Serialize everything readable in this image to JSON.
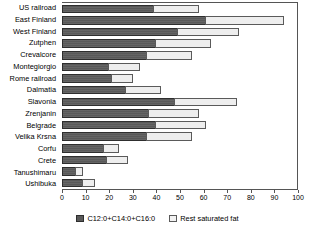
{
  "chart_data": {
    "type": "bar",
    "orientation": "horizontal",
    "stacked": true,
    "title": "",
    "subtitle": "",
    "xlabel": "",
    "ylabel": "",
    "xlim": [
      0,
      100
    ],
    "xticks": [
      0,
      10,
      20,
      30,
      40,
      50,
      60,
      70,
      80,
      90,
      100
    ],
    "xtick_labels": [
      "0",
      "10",
      "20",
      "30",
      "40",
      "50",
      "60",
      "70",
      "80",
      "90",
      "100"
    ],
    "grid": false,
    "legend_position": "bottom",
    "categories": [
      "US railroad",
      "East Finland",
      "West Finland",
      "Zutphen",
      "Crevalcore",
      "Montegiorgio",
      "Rome railroad",
      "Dalmatia",
      "Slavonia",
      "Zrenjanin",
      "Belgrade",
      "Velika Krsna",
      "Corfu",
      "Crete",
      "Tanushimaru",
      "Ushibuka"
    ],
    "series": [
      {
        "name": "C12:0+C14:0+C16:0",
        "color": "#595959",
        "values": [
          39,
          61,
          49,
          40,
          36,
          20,
          21,
          27,
          48,
          37,
          40,
          36,
          18,
          19,
          6,
          9
        ]
      },
      {
        "name": "Rest saturated fat",
        "color": "#eeeeee",
        "values": [
          19,
          33,
          26,
          23,
          19,
          13,
          9,
          15,
          26,
          21,
          21,
          19,
          6,
          9,
          3,
          5
        ]
      }
    ],
    "totals": [
      58,
      94,
      75,
      63,
      55,
      33,
      30,
      42,
      74,
      58,
      61,
      55,
      24,
      28,
      9,
      14
    ]
  },
  "legend": {
    "items": [
      {
        "label": "C12:0+C14:0+C16:0",
        "swatch": "dark-swatch-icon"
      },
      {
        "label": "Rest saturated fat",
        "swatch": "light-swatch-icon"
      }
    ]
  }
}
